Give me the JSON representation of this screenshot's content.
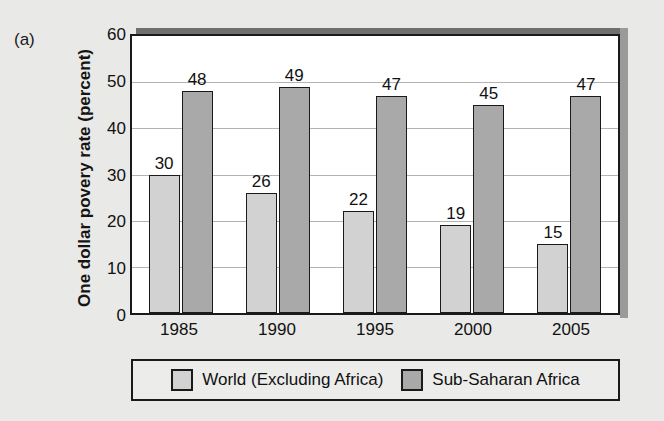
{
  "panel_label": "(a)",
  "scan_artifact_text": "",
  "colors": {
    "page_background": "#e9e9e7",
    "plot_background": "#ffffff",
    "axis": "#1a1a1a",
    "gridline": "#b3b3b3",
    "series_world": "#d2d2d2",
    "series_africa": "#a9a9a9",
    "shadow_top": "#6f6f6f",
    "shadow_right": "#9a9a9a",
    "legend_background": "#ececeb"
  },
  "axes": {
    "y_title": "One dollar povery rate (percent)",
    "y_ticks": [
      "0",
      "10",
      "20",
      "30",
      "40",
      "50",
      "60"
    ],
    "x_ticks": [
      "1985",
      "1990",
      "1995",
      "2000",
      "2005"
    ]
  },
  "legend": {
    "items": [
      {
        "label": "World (Excluding Africa)",
        "swatch": "series-0"
      },
      {
        "label": "Sub-Saharan Africa",
        "swatch": "series-1"
      }
    ]
  },
  "chart_data": {
    "type": "bar",
    "title": "",
    "subtitle": "",
    "panel": "(a)",
    "xlabel": "",
    "ylabel": "One dollar povery rate (percent)",
    "categories": [
      "1985",
      "1990",
      "1995",
      "2000",
      "2005"
    ],
    "series": [
      {
        "name": "World (Excluding Africa)",
        "color": "#d2d2d2",
        "values": [
          30,
          26,
          22,
          19,
          15
        ],
        "labels": [
          "30",
          "26",
          "22",
          "19",
          "15"
        ]
      },
      {
        "name": "Sub-Saharan Africa",
        "color": "#a9a9a9",
        "values": [
          48,
          49,
          47,
          45,
          47
        ],
        "labels": [
          "48",
          "49",
          "47",
          "45",
          "47"
        ]
      }
    ],
    "ylim": [
      0,
      60
    ],
    "ytick_step": 10,
    "grid": true,
    "grid_axis": "y",
    "legend_position": "bottom",
    "data_labels": true,
    "bar_grouping": "grouped"
  }
}
